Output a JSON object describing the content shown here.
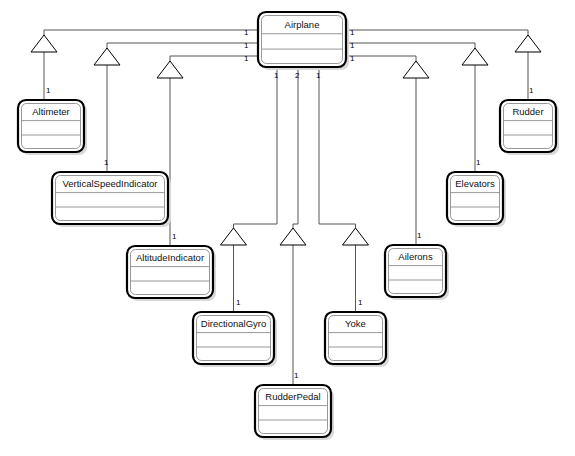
{
  "diagram": {
    "type": "uml-class-diagram",
    "canvas": {
      "width": 575,
      "height": 456,
      "background": "#ffffff"
    },
    "style": {
      "line_color": "#555555",
      "box_border_color": "#000000",
      "box_fill": "#ffffff",
      "shadow_color": "#d8d8d8",
      "text_color": "#111111"
    }
  },
  "classes": [
    {
      "id": "airplane",
      "name": "Airplane",
      "x": 258,
      "y": 12,
      "w": 88,
      "h": 55
    },
    {
      "id": "altimeter",
      "name": "Altimeter",
      "x": 18,
      "y": 100,
      "w": 66,
      "h": 52
    },
    {
      "id": "verticalspeedindicator",
      "name": "VerticalSpeedIndicator",
      "x": 52,
      "y": 172,
      "w": 116,
      "h": 52
    },
    {
      "id": "altitudeindicator",
      "name": "AltitudeIndicator",
      "x": 127,
      "y": 246,
      "w": 86,
      "h": 52
    },
    {
      "id": "directionalgyro",
      "name": "DirectionalGyro",
      "x": 193,
      "y": 312,
      "w": 81,
      "h": 52
    },
    {
      "id": "rudderpedal",
      "name": "RudderPedal",
      "x": 255,
      "y": 385,
      "w": 76,
      "h": 52
    },
    {
      "id": "yoke",
      "name": "Yoke",
      "x": 325,
      "y": 312,
      "w": 61,
      "h": 52
    },
    {
      "id": "ailerons",
      "name": "Ailerons",
      "x": 385,
      "y": 245,
      "w": 61,
      "h": 52
    },
    {
      "id": "elevators",
      "name": "Elevators",
      "x": 447,
      "y": 172,
      "w": 56,
      "h": 52
    },
    {
      "id": "rudder",
      "name": "Rudder",
      "x": 500,
      "y": 100,
      "w": 56,
      "h": 52
    }
  ],
  "associations": [
    {
      "id": "a1",
      "from": "airplane",
      "to": "altimeter",
      "from_multiplicity": "1",
      "to_multiplicity": "1",
      "arrow": "open-triangle",
      "arrow_at": "airplane"
    },
    {
      "id": "a2",
      "from": "airplane",
      "to": "verticalspeedindicator",
      "from_multiplicity": "1",
      "to_multiplicity": "1",
      "arrow": "open-triangle",
      "arrow_at": "airplane"
    },
    {
      "id": "a3",
      "from": "airplane",
      "to": "altitudeindicator",
      "from_multiplicity": "1",
      "to_multiplicity": "1",
      "arrow": "open-triangle",
      "arrow_at": "airplane"
    },
    {
      "id": "a4",
      "from": "airplane",
      "to": "directionalgyro",
      "from_multiplicity": "1",
      "to_multiplicity": "1",
      "arrow": "open-triangle",
      "arrow_at": "airplane"
    },
    {
      "id": "a5",
      "from": "airplane",
      "to": "rudderpedal",
      "from_multiplicity": "2",
      "to_multiplicity": "1",
      "arrow": "open-triangle",
      "arrow_at": "airplane"
    },
    {
      "id": "a6",
      "from": "airplane",
      "to": "yoke",
      "from_multiplicity": "1",
      "to_multiplicity": "1",
      "arrow": "open-triangle",
      "arrow_at": "airplane"
    },
    {
      "id": "a7",
      "from": "airplane",
      "to": "ailerons",
      "from_multiplicity": "1",
      "to_multiplicity": "1",
      "arrow": "open-triangle",
      "arrow_at": "airplane"
    },
    {
      "id": "a8",
      "from": "airplane",
      "to": "elevators",
      "from_multiplicity": "1",
      "to_multiplicity": "1",
      "arrow": "open-triangle",
      "arrow_at": "airplane"
    },
    {
      "id": "a9",
      "from": "airplane",
      "to": "rudder",
      "from_multiplicity": "1",
      "to_multiplicity": "1",
      "arrow": "open-triangle",
      "arrow_at": "airplane"
    }
  ],
  "multiplicity_labels": [
    {
      "id": "m-left-1",
      "text": "1",
      "x": 244,
      "y": 35
    },
    {
      "id": "m-left-2",
      "text": "1",
      "x": 244,
      "y": 48
    },
    {
      "id": "m-left-3",
      "text": "1",
      "x": 244,
      "y": 61
    },
    {
      "id": "m-right-1",
      "text": "1",
      "x": 350,
      "y": 35
    },
    {
      "id": "m-right-2",
      "text": "1",
      "x": 350,
      "y": 48
    },
    {
      "id": "m-right-3",
      "text": "1",
      "x": 350,
      "y": 61
    },
    {
      "id": "m-bot-1",
      "text": "1",
      "x": 274,
      "y": 78
    },
    {
      "id": "m-bot-2",
      "text": "2",
      "x": 295,
      "y": 78
    },
    {
      "id": "m-bot-3",
      "text": "1",
      "x": 316,
      "y": 78
    },
    {
      "id": "m-altimeter",
      "text": "1",
      "x": 46,
      "y": 93
    },
    {
      "id": "m-rudder",
      "text": "1",
      "x": 529,
      "y": 93
    },
    {
      "id": "m-verticalspeed",
      "text": "1",
      "x": 104,
      "y": 165
    },
    {
      "id": "m-elevators",
      "text": "1",
      "x": 476,
      "y": 165
    },
    {
      "id": "m-altitudeind",
      "text": "1",
      "x": 172,
      "y": 239
    },
    {
      "id": "m-ailerons",
      "text": "1",
      "x": 417,
      "y": 238
    },
    {
      "id": "m-directionalgyro",
      "text": "1",
      "x": 236,
      "y": 305
    },
    {
      "id": "m-yoke",
      "text": "1",
      "x": 358,
      "y": 305
    },
    {
      "id": "m-rudderpedal",
      "text": "1",
      "x": 294,
      "y": 378
    }
  ]
}
